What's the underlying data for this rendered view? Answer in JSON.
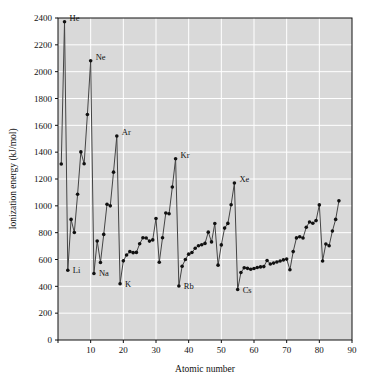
{
  "chart_data": {
    "type": "line",
    "title": "",
    "xlabel": "Atomic number",
    "ylabel": "Ionization energy (kJ/mol)",
    "xlim": [
      0,
      90
    ],
    "ylim": [
      0,
      2400
    ],
    "xticks": [
      0,
      10,
      20,
      30,
      40,
      50,
      60,
      70,
      80,
      90
    ],
    "xtick_labels": [
      "",
      "10",
      "20",
      "30",
      "40",
      "50",
      "60",
      "70",
      "80",
      "90"
    ],
    "yticks": [
      0,
      200,
      400,
      600,
      800,
      1000,
      1200,
      1400,
      1600,
      1800,
      2000,
      2200,
      2400
    ],
    "ytick_labels": [
      "0",
      "200",
      "400",
      "600",
      "800",
      "1000",
      "1200",
      "1400",
      "1600",
      "1800",
      "2000",
      "2200",
      "2400"
    ],
    "grid": true,
    "grid_color": "#ffffff",
    "plot_background": "#d9d9d9",
    "line_color": "#444444",
    "marker_color": "#111111",
    "marker": "circle",
    "legend": "none",
    "x": [
      1,
      2,
      3,
      4,
      5,
      6,
      7,
      8,
      9,
      10,
      11,
      12,
      13,
      14,
      15,
      16,
      17,
      18,
      19,
      20,
      21,
      22,
      23,
      24,
      25,
      26,
      27,
      28,
      29,
      30,
      31,
      32,
      33,
      34,
      35,
      36,
      37,
      38,
      39,
      40,
      41,
      42,
      43,
      44,
      45,
      46,
      47,
      48,
      49,
      50,
      51,
      52,
      53,
      54,
      55,
      56,
      57,
      58,
      59,
      60,
      61,
      62,
      63,
      64,
      65,
      66,
      67,
      68,
      69,
      70,
      71,
      72,
      73,
      74,
      75,
      76,
      77,
      78,
      79,
      80,
      81,
      82,
      83,
      84,
      85,
      86
    ],
    "y": [
      1312,
      2372,
      520,
      899,
      801,
      1086,
      1402,
      1314,
      1681,
      2081,
      496,
      738,
      578,
      787,
      1012,
      1000,
      1251,
      1521,
      419,
      590,
      633,
      659,
      651,
      653,
      717,
      762,
      760,
      737,
      746,
      906,
      579,
      762,
      947,
      941,
      1140,
      1351,
      403,
      550,
      600,
      640,
      652,
      684,
      702,
      710,
      720,
      804,
      731,
      868,
      558,
      709,
      834,
      869,
      1008,
      1170,
      376,
      503,
      538,
      534,
      527,
      533,
      540,
      545,
      547,
      593,
      566,
      573,
      581,
      589,
      597,
      603,
      524,
      659,
      761,
      770,
      760,
      840,
      880,
      870,
      890,
      1007,
      589,
      716,
      703,
      812,
      899,
      1037
    ],
    "series_name": "First ionization energy",
    "point_labels": [
      {
        "element": "He",
        "atomic_number": 2,
        "value": 2372,
        "dx": 5,
        "dy": -1
      },
      {
        "element": "Ne",
        "atomic_number": 10,
        "value": 2081,
        "dx": 5,
        "dy": -1
      },
      {
        "element": "Ar",
        "atomic_number": 18,
        "value": 1521,
        "dx": 5,
        "dy": -1
      },
      {
        "element": "Kr",
        "atomic_number": 36,
        "value": 1351,
        "dx": 5,
        "dy": -1
      },
      {
        "element": "Xe",
        "atomic_number": 54,
        "value": 1170,
        "dx": 5,
        "dy": -1
      },
      {
        "element": "Li",
        "atomic_number": 3,
        "value": 520,
        "dx": 5,
        "dy": 3
      },
      {
        "element": "Na",
        "atomic_number": 11,
        "value": 496,
        "dx": 5,
        "dy": 3
      },
      {
        "element": "K",
        "atomic_number": 19,
        "value": 419,
        "dx": 5,
        "dy": 3
      },
      {
        "element": "Rb",
        "atomic_number": 37,
        "value": 403,
        "dx": 5,
        "dy": 3
      },
      {
        "element": "Cs",
        "atomic_number": 55,
        "value": 376,
        "dx": 5,
        "dy": 3
      }
    ]
  }
}
